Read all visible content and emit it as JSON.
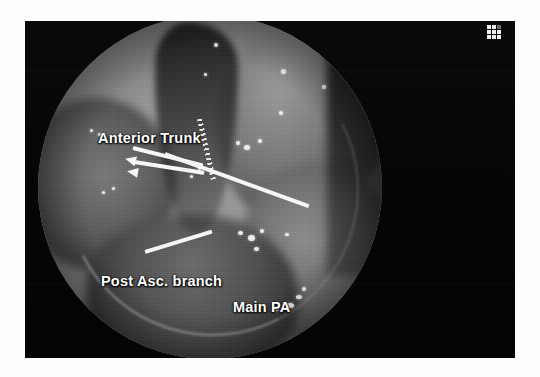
{
  "figure": {
    "kind": "endoscopic-surgical-photograph",
    "modality": "video-assisted thoracoscopic surgery (VATS)",
    "background_color": "#fdfdfd",
    "frame_color": "#050505"
  },
  "annotations": {
    "labels": [
      {
        "id": "anterior-trunk",
        "text": "Anterior Trunk",
        "color": "#ffffff"
      },
      {
        "id": "post-asc-branch",
        "text": "Post Asc. branch",
        "color": "#ffffff"
      },
      {
        "id": "main-pa",
        "text": "Main PA",
        "color": "#ffffff"
      }
    ],
    "pointers": [
      {
        "id": "anterior-trunk-pointer-upper",
        "points_to": "anterior trunk stump",
        "color": "#f6f6f6"
      },
      {
        "id": "anterior-trunk-pointer-lower",
        "points_to": "anterior trunk stump",
        "color": "#f6f6f6"
      },
      {
        "id": "main-pa-pointer",
        "points_to": "main pulmonary artery",
        "color": "#f6f6f6"
      },
      {
        "id": "post-asc-branch-pointer",
        "points_to": "posterior ascending branch",
        "color": "#f6f6f6"
      }
    ],
    "instruments": [
      {
        "id": "stapler-line",
        "name": "endoscopic vascular stapler staple line",
        "color": "#e8e8e8"
      }
    ]
  },
  "marker": {
    "id": "grid-marker",
    "name": "grid-marker",
    "rows": 3,
    "columns": 3,
    "color": "#f0f0f0"
  }
}
